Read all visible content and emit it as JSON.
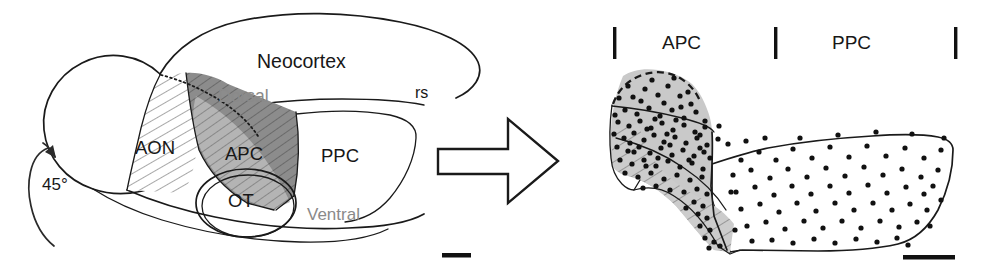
{
  "figure": {
    "background_color": "#ffffff",
    "label_color_black": "#171717",
    "label_color_gray": "#8a8a8a",
    "shade_apc_dark": "#8c8c8c",
    "shade_apc_light": "#c9c9c9",
    "line_color": "#1a1a1a"
  },
  "left_panel": {
    "name": "lateral-brain-view",
    "labels": {
      "neocortex": "Neocortex",
      "dorsal": "Dorsal",
      "ventral": "Ventral",
      "rs": "rs",
      "aon": "AON",
      "apc": "APC",
      "ppc": "PPC",
      "ot": "OT",
      "rotation": "45°"
    },
    "scale_bar": {
      "name": "scale-bar-left",
      "visible": true
    }
  },
  "transform_arrow": {
    "name": "transform-arrow",
    "direction": "right"
  },
  "right_panel": {
    "name": "unfolded-map-view",
    "labels": {
      "apc": "APC",
      "ppc": "PPC"
    },
    "tick_marks": 3,
    "scale_bar": {
      "name": "scale-bar-right",
      "visible": true
    },
    "map_data": {
      "apc_region": {
        "shaded": true,
        "hatched": true,
        "dot_density": "high"
      },
      "ppc_region": {
        "shaded": false,
        "hatched": false,
        "dot_density": "low"
      }
    }
  }
}
